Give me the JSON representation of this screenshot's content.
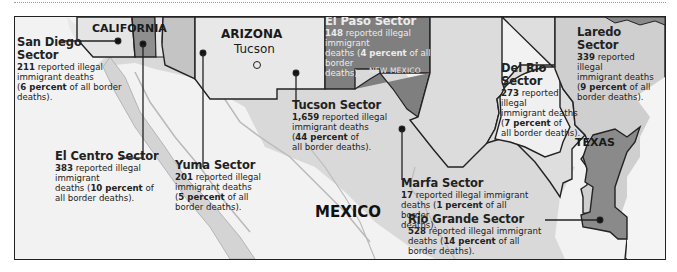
{
  "colors": {
    "background_land": "#f2f2f2",
    "mexico_land": "#d9d9d9",
    "us_state_light": "#d2d2d2",
    "sector_light": "#e3e3e3",
    "sector_medium": "#a8a8a8",
    "sector_dark": "#7c7c7c",
    "el_paso_sector": "#808080",
    "border_line": "#222222",
    "leader_line": "#333333"
  },
  "map": {
    "states": {
      "california": "CALIFORNIA",
      "arizona": "ARIZONA",
      "new_mexico": "NEW MEXICO",
      "texas": "TEXAS"
    },
    "country": "MEXICO",
    "city": {
      "name": "Tucson",
      "marker_icon": "open-circle"
    }
  },
  "sectors": [
    {
      "id": "san_diego",
      "name": "San Diego Sector",
      "deaths": "211",
      "line1": " reported illegal",
      "line2": "immigrant deaths",
      "pct_open": "(",
      "percent": "6 percent",
      "pct_rest": " of all border",
      "line4": "deaths)."
    },
    {
      "id": "el_centro",
      "name": "El Centro Sector",
      "deaths": "383",
      "line1": " reported illegal immigrant",
      "line2_pre": "deaths (",
      "percent": "10 percent",
      "line2_post": " of",
      "line3": "all border deaths)."
    },
    {
      "id": "yuma",
      "name": "Yuma Sector",
      "deaths": "201",
      "line1": " reported illegal",
      "line2": "immigrant deaths",
      "pct_open": "(",
      "percent": "5 percent",
      "pct_rest": " of all",
      "line4": "border deaths)."
    },
    {
      "id": "tucson",
      "name": "Tucson Sector",
      "deaths": "1,659",
      "line1": " reported illegal",
      "line2": "immigrant deaths",
      "pct_open": "(",
      "percent": "44 percent",
      "pct_rest": " of",
      "line4": "all border deaths)."
    },
    {
      "id": "el_paso",
      "name": "El Paso Sector",
      "deaths": "148",
      "line1": " reported illegal immigrant",
      "line2_pre": "deaths (",
      "percent": "4 percent",
      "line2_post": " of all border",
      "line3": "deaths)."
    },
    {
      "id": "marfa",
      "name": "Marfa Sector",
      "deaths": "17",
      "line1": " reported illegal immigrant",
      "line2_pre": "deaths (",
      "percent": "1 percent",
      "line2_post": " of all border",
      "line3": "deaths)."
    },
    {
      "id": "del_rio",
      "name": "Del Rio Sector",
      "deaths": "273",
      "line1": " reported illegal",
      "line2": "immigrant deaths",
      "pct_open": "(",
      "percent": "7 percent",
      "pct_rest": " of",
      "line4": "all border deaths)."
    },
    {
      "id": "laredo",
      "name": "Laredo Sector",
      "deaths": "339",
      "line1": " reported illegal",
      "line2": "immigrant deaths",
      "pct_open": "(",
      "percent": "9 percent",
      "pct_rest": " of all",
      "line4": "border deaths)."
    },
    {
      "id": "rio_grande",
      "name": "Rio Grande Sector",
      "deaths": "528",
      "line1": " reported illegal immigrant",
      "line2_pre": "deaths (",
      "percent": "14 percent",
      "line2_post": " of all",
      "line3": "border deaths)."
    }
  ]
}
